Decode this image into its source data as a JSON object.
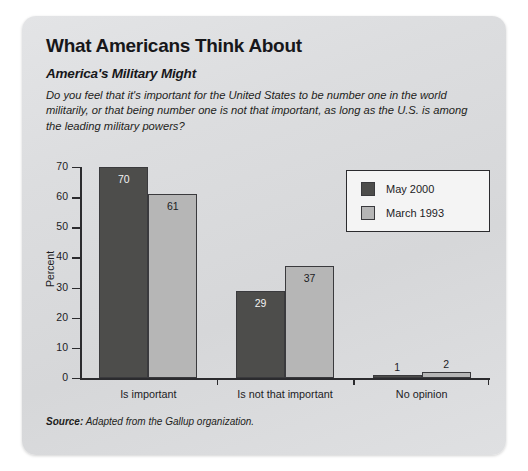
{
  "card": {
    "title": "What Americans Think About",
    "subtitle": "America's Military Might",
    "question": "Do you feel that it's important for the United States to be number one in the world militarily, or that being number one is not that important, as long as the U.S. is among the leading military powers?",
    "source_keyword": "Source:",
    "source_text": "Adapted from the Gallup organization."
  },
  "colors": {
    "series_dark": "#4d4d4b",
    "series_light": "#b6b6b6",
    "axis": "#2b2b2e",
    "card_background": "#dcdddf",
    "legend_background": "#f4f4f4"
  },
  "chart_data": {
    "type": "bar",
    "title": "What Americans Think About",
    "subtitle": "America's Military Might",
    "xlabel": "",
    "ylabel": "Percent",
    "ylim": [
      0,
      70
    ],
    "yticks": [
      0,
      10,
      20,
      30,
      40,
      50,
      60,
      70
    ],
    "ytick_labels": [
      "0",
      "10",
      "20",
      "30",
      "40",
      "50",
      "60",
      "70"
    ],
    "grid": false,
    "legend_position": "top-right",
    "categories": [
      "Is important",
      "Is not that important",
      "No opinion"
    ],
    "series": [
      {
        "name": "May 2000",
        "color": "#4d4d4b",
        "values": [
          70,
          29,
          1
        ]
      },
      {
        "name": "March 1993",
        "color": "#b6b6b6",
        "values": [
          61,
          37,
          2
        ]
      }
    ],
    "value_labels": [
      [
        "70",
        "29",
        "1"
      ],
      [
        "61",
        "37",
        "2"
      ]
    ],
    "source": "Source: Adapted from the Gallup organization."
  }
}
